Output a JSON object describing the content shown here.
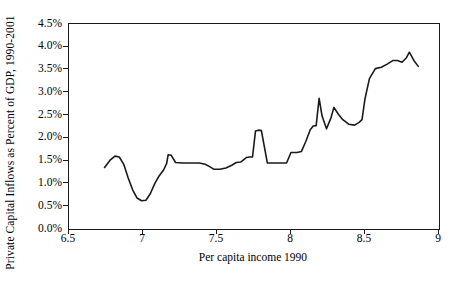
{
  "chart_data": {
    "type": "line",
    "title": "",
    "xlabel": "Per capita income 1990",
    "ylabel": "Private Capital Inflows as Percent of GDP, 1990-2001",
    "xlim": [
      6.5,
      9
    ],
    "ylim": [
      0,
      4.5
    ],
    "xticks": [
      "6.5",
      "7",
      "7.5",
      "8",
      "8.5",
      "9"
    ],
    "xtick_values": [
      6.5,
      7,
      7.5,
      8,
      8.5,
      9
    ],
    "yticks": [
      "0.0%",
      "0.5%",
      "1.0%",
      "1.5%",
      "2.0%",
      "2.5%",
      "3.0%",
      "3.5%",
      "4.0%",
      "4.5%"
    ],
    "ytick_values": [
      0,
      0.5,
      1,
      1.5,
      2,
      2.5,
      3,
      3.5,
      4,
      4.5
    ],
    "grid": false,
    "legend": null,
    "line_color": "#1a1a1a",
    "line_width": 1.6,
    "markers": false,
    "series": [
      {
        "name": "Private capital inflows",
        "x": [
          6.74,
          6.78,
          6.81,
          6.84,
          6.87,
          6.9,
          6.93,
          6.96,
          6.99,
          7.02,
          7.05,
          7.08,
          7.11,
          7.14,
          7.16,
          7.17,
          7.19,
          7.22,
          7.27,
          7.33,
          7.38,
          7.42,
          7.45,
          7.48,
          7.52,
          7.56,
          7.6,
          7.63,
          7.66,
          7.7,
          7.72,
          7.74,
          7.76,
          7.78,
          7.8,
          7.84,
          7.9,
          7.95,
          7.97,
          8.0,
          8.04,
          8.07,
          8.1,
          8.13,
          8.15,
          8.17,
          8.19,
          8.21,
          8.24,
          8.27,
          8.29,
          8.32,
          8.35,
          8.39,
          8.43,
          8.46,
          8.48,
          8.5,
          8.53,
          8.57,
          8.61,
          8.65,
          8.69,
          8.72,
          8.75,
          8.78,
          8.8,
          8.83,
          8.86
        ],
        "y": [
          1.35,
          1.52,
          1.6,
          1.58,
          1.42,
          1.12,
          0.86,
          0.68,
          0.62,
          0.63,
          0.78,
          1.0,
          1.17,
          1.3,
          1.44,
          1.63,
          1.62,
          1.46,
          1.45,
          1.45,
          1.45,
          1.42,
          1.37,
          1.31,
          1.31,
          1.34,
          1.4,
          1.46,
          1.47,
          1.57,
          1.58,
          1.58,
          2.15,
          2.17,
          2.16,
          1.45,
          1.45,
          1.45,
          1.45,
          1.68,
          1.68,
          1.7,
          1.92,
          2.18,
          2.26,
          2.27,
          2.87,
          2.48,
          2.2,
          2.44,
          2.67,
          2.52,
          2.4,
          2.3,
          2.28,
          2.34,
          2.4,
          2.86,
          3.3,
          3.52,
          3.55,
          3.62,
          3.7,
          3.7,
          3.66,
          3.76,
          3.88,
          3.7,
          3.57
        ]
      }
    ]
  },
  "axes": {
    "y_title": "Private Capital Inflows as Percent of GDP, 1990-2001",
    "x_title": "Per capita income 1990",
    "y_tick_labels": [
      "4.5%",
      "4.0%",
      "3.5%",
      "3.0%",
      "2.5%",
      "2.0%",
      "1.5%",
      "1.0%",
      "0.5%",
      "0.0%"
    ],
    "x_tick_labels": [
      "6.5",
      "7",
      "7.5",
      "8",
      "8.5",
      "9"
    ]
  }
}
